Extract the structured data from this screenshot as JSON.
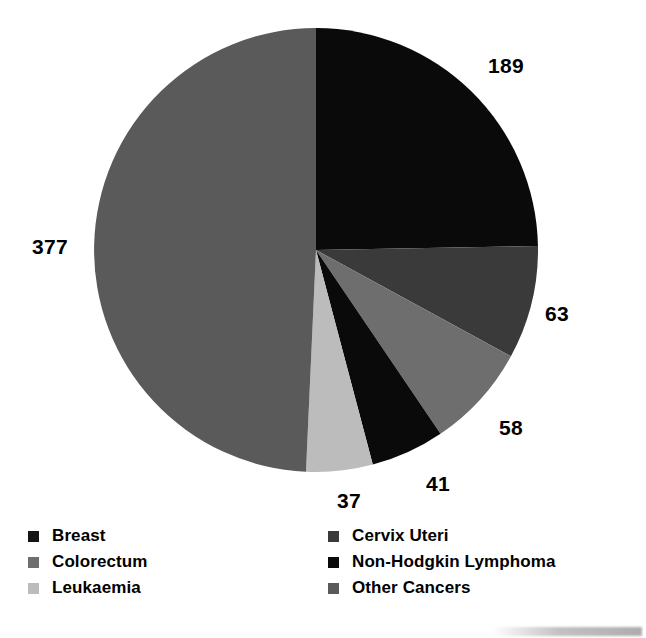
{
  "chart_data": {
    "type": "pie",
    "title": "",
    "subtitle": "",
    "xlabel": "",
    "ylabel": "",
    "total": 765,
    "units": "cases",
    "start_angle_deg": 0,
    "direction": "clockwise",
    "grid": false,
    "legend_position": "bottom",
    "legend_columns": 2,
    "categories": [
      "Breast",
      "Cervix Uteri",
      "Colorectum",
      "Non-Hodgkin Lymphoma",
      "Leukaemia",
      "Other Cancers"
    ],
    "values": [
      189,
      63,
      58,
      41,
      37,
      377
    ],
    "slices": [
      {
        "label": "Breast",
        "value": 189,
        "display_value": "189",
        "color": "#0a0a0a",
        "percent": 24.7,
        "angle_deg": 88.9
      },
      {
        "label": "Cervix Uteri",
        "value": 63,
        "display_value": "63",
        "color": "#3a3a3a",
        "percent": 8.2,
        "angle_deg": 29.6
      },
      {
        "label": "Colorectum",
        "value": 58,
        "display_value": "58",
        "color": "#6e6e6e",
        "percent": 7.6,
        "angle_deg": 27.3
      },
      {
        "label": "Non-Hodgkin Lymphoma",
        "value": 41,
        "display_value": "41",
        "color": "#0a0a0a",
        "percent": 5.4,
        "angle_deg": 19.3
      },
      {
        "label": "Leukaemia",
        "value": 37,
        "display_value": "37",
        "color": "#bcbcbc",
        "percent": 4.8,
        "angle_deg": 17.4
      },
      {
        "label": "Other Cancers",
        "value": 377,
        "display_value": "377",
        "color": "#5a5a5a",
        "percent": 49.3,
        "angle_deg": 177.4
      }
    ],
    "value_labels": [
      {
        "text": "189",
        "x": 488,
        "y": 55
      },
      {
        "text": "63",
        "x": 545,
        "y": 303
      },
      {
        "text": "58",
        "x": 499,
        "y": 417
      },
      {
        "text": "41",
        "x": 426,
        "y": 473
      },
      {
        "text": "37",
        "x": 337,
        "y": 490
      },
      {
        "text": "377",
        "x": 32,
        "y": 236
      }
    ],
    "geometry": {
      "center_x": 316,
      "center_y": 250,
      "radius": 222
    }
  },
  "legend": {
    "columns": [
      {
        "entries": [
          {
            "label": "Breast",
            "color": "#141414",
            "swatch_name": "legend-swatch-breast"
          },
          {
            "label": "Colorectum",
            "color": "#6e6e6e",
            "swatch_name": "legend-swatch-colorectum"
          },
          {
            "label": "Leukaemia",
            "color": "#bcbcbc",
            "swatch_name": "legend-swatch-leukaemia"
          }
        ]
      },
      {
        "entries": [
          {
            "label": "Cervix Uteri",
            "color": "#3a3a3a",
            "swatch_name": "legend-swatch-cervix-uteri"
          },
          {
            "label": "Non-Hodgkin Lymphoma",
            "color": "#0a0a0a",
            "swatch_name": "legend-swatch-non-hodgkin-lymphoma"
          },
          {
            "label": "Other Cancers",
            "color": "#5a5a5a",
            "swatch_name": "legend-swatch-other-cancers"
          }
        ]
      }
    ]
  },
  "colors": {
    "background": "#ffffff",
    "text": "#000000"
  }
}
